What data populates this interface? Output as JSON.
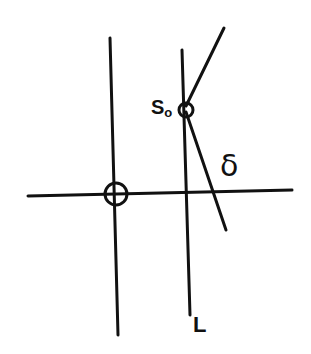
{
  "diagram": {
    "background": "#ffffff",
    "stroke_color": "#111111",
    "labels": {
      "s0_main": "S",
      "s0_sub": "o",
      "delta": "δ",
      "L": "L"
    },
    "elements": [
      {
        "id": "horizontal-axis",
        "type": "line",
        "x1": 28,
        "y1": 196,
        "x2": 292,
        "y2": 190
      },
      {
        "id": "vertical-axis-left",
        "type": "line",
        "x1": 110,
        "y1": 38,
        "x2": 118,
        "y2": 335
      },
      {
        "id": "line-L",
        "type": "line",
        "x1": 182,
        "y1": 50,
        "x2": 190,
        "y2": 315,
        "label": "L"
      },
      {
        "id": "origin-marker",
        "type": "circle",
        "cx": 116,
        "cy": 194,
        "r": 11
      },
      {
        "id": "s0-point",
        "type": "circle",
        "cx": 186,
        "cy": 110,
        "r": 7,
        "label": "S₀"
      },
      {
        "id": "upper-ray",
        "type": "line",
        "x1": 186,
        "y1": 106,
        "x2": 224,
        "y2": 28
      },
      {
        "id": "delta-line",
        "type": "line",
        "x1": 186,
        "y1": 112,
        "x2": 226,
        "y2": 230,
        "label": "δ"
      }
    ]
  }
}
